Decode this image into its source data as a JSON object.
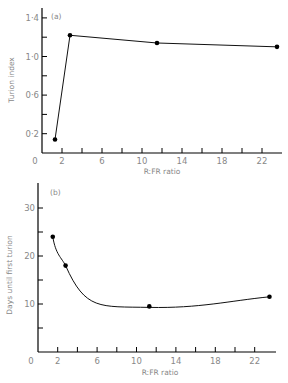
{
  "chart_data": [
    {
      "type": "line",
      "panel": "(a)",
      "xlabel": "R:FR ratio",
      "ylabel": "Turion index",
      "xlim": [
        0,
        24
      ],
      "ylim": [
        0,
        1.4
      ],
      "xticks": [
        "0",
        "2",
        "6",
        "10",
        "14",
        "18",
        "22"
      ],
      "yticks": [
        "0·2",
        "0·6",
        "1·0",
        "1·4"
      ],
      "grid": false,
      "series": [
        {
          "name": "Turion index",
          "x": [
            1.3,
            2.8,
            11.5,
            23.5
          ],
          "y": [
            0.14,
            1.22,
            1.14,
            1.1
          ]
        }
      ]
    },
    {
      "type": "line",
      "panel": "(b)",
      "xlabel": "R:FR ratio",
      "ylabel": "Days until first turion",
      "xlim": [
        0,
        24
      ],
      "ylim": [
        0,
        35
      ],
      "xticks": [
        "0",
        "2",
        "6",
        "10",
        "14",
        "18",
        "22"
      ],
      "yticks": [
        "10",
        "20",
        "30"
      ],
      "grid": false,
      "series": [
        {
          "name": "Days until first turion",
          "x": [
            1.5,
            2.8,
            11.3,
            23.5
          ],
          "y": [
            24,
            18,
            9.5,
            11.5
          ]
        }
      ]
    }
  ]
}
